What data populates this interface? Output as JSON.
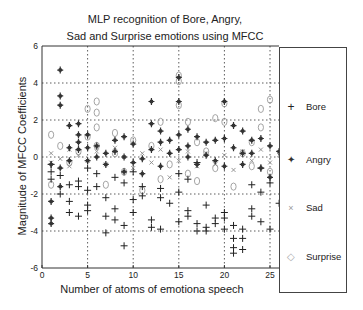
{
  "chart_data": {
    "type": "scatter",
    "title_lines": [
      "MLP recognition of Bore, Angry,",
      "Sad and Surprise emotions using MFCC"
    ],
    "xlabel": "Number of atoms of emotiona speech",
    "ylabel": "Magnitude of MFCC Coefficients",
    "xlim": [
      0,
      26
    ],
    "ylim": [
      -6,
      6
    ],
    "xticks": [
      0,
      5,
      10,
      15,
      20,
      25
    ],
    "yticks": [
      -6,
      -4,
      -2,
      0,
      2,
      4,
      6
    ],
    "grid": true,
    "legend_position": "right-outside",
    "series": [
      {
        "name": "Bore",
        "marker": "+",
        "color": "#222222",
        "points": [
          [
            1,
            -0.4
          ],
          [
            1,
            -0.8
          ],
          [
            1,
            -1.2
          ],
          [
            2,
            -1.0
          ],
          [
            2,
            -2.0
          ],
          [
            3,
            -1.5
          ],
          [
            3,
            -2.4
          ],
          [
            3,
            -3.0
          ],
          [
            4,
            -1.3
          ],
          [
            4,
            -1.6
          ],
          [
            4,
            -3.2
          ],
          [
            5,
            -0.6
          ],
          [
            5,
            -1.8
          ],
          [
            5,
            -2.6
          ],
          [
            5,
            -2.9
          ],
          [
            6,
            -0.9
          ],
          [
            6,
            -1.6
          ],
          [
            7,
            -2.2
          ],
          [
            7,
            -3.2
          ],
          [
            7,
            -4.1
          ],
          [
            8,
            -1.1
          ],
          [
            8,
            -2.8
          ],
          [
            8,
            -3.4
          ],
          [
            9,
            -1.4
          ],
          [
            9,
            -3.7
          ],
          [
            9,
            -4.8
          ],
          [
            10,
            -0.8
          ],
          [
            10,
            -2.3
          ],
          [
            10,
            -3.0
          ],
          [
            11,
            -1.6
          ],
          [
            11,
            -2.1
          ],
          [
            12,
            -3.4
          ],
          [
            12,
            -3.8
          ],
          [
            13,
            -1.7
          ],
          [
            13,
            -2.2
          ],
          [
            13,
            -3.9
          ],
          [
            14,
            -2.5
          ],
          [
            15,
            -0.9
          ],
          [
            15,
            -1.9
          ],
          [
            15,
            -3.5
          ],
          [
            16,
            -1.2
          ],
          [
            16,
            -2.9
          ],
          [
            16,
            -3.2
          ],
          [
            17,
            -0.3
          ],
          [
            17,
            -3.6
          ],
          [
            17,
            -4.0
          ],
          [
            18,
            -2.6
          ],
          [
            18,
            -3.8
          ],
          [
            18,
            -4.0
          ],
          [
            19,
            -3.3
          ],
          [
            19,
            -3.6
          ],
          [
            20,
            -3.0
          ],
          [
            20,
            -3.3
          ],
          [
            20,
            -3.9
          ],
          [
            21,
            -3.7
          ],
          [
            21,
            -4.4
          ],
          [
            21,
            -4.9
          ],
          [
            21,
            -5.2
          ],
          [
            22,
            -3.9
          ],
          [
            22,
            -4.4
          ],
          [
            22,
            -5.0
          ],
          [
            23,
            -1.5
          ],
          [
            23,
            -2.8
          ],
          [
            23,
            -3.2
          ],
          [
            24,
            -0.6
          ],
          [
            24,
            -1.9
          ],
          [
            24,
            -3.5
          ],
          [
            25,
            -1.4
          ],
          [
            25,
            -3.9
          ],
          [
            26,
            -2.5
          ]
        ]
      },
      {
        "name": "Angry",
        "marker": "*",
        "color": "#333333",
        "points": [
          [
            1,
            -0.4
          ],
          [
            1,
            -2.4
          ],
          [
            1,
            -3.3
          ],
          [
            1,
            -3.6
          ],
          [
            2,
            4.7
          ],
          [
            2,
            3.3
          ],
          [
            2,
            2.8
          ],
          [
            2,
            -0.6
          ],
          [
            2,
            -1.6
          ],
          [
            3,
            1.7
          ],
          [
            3,
            0.5
          ],
          [
            3,
            -0.2
          ],
          [
            4,
            1.8
          ],
          [
            4,
            1.2
          ],
          [
            4,
            0.8
          ],
          [
            4,
            0.4
          ],
          [
            5,
            1.2
          ],
          [
            5,
            0.5
          ],
          [
            5,
            -0.2
          ],
          [
            6,
            0.6
          ],
          [
            6,
            0.0
          ],
          [
            7,
            0.2
          ],
          [
            7,
            -0.4
          ],
          [
            8,
            0.9
          ],
          [
            8,
            0.3
          ],
          [
            9,
            1.1
          ],
          [
            9,
            0.0
          ],
          [
            9,
            -0.8
          ],
          [
            10,
            0.7
          ],
          [
            10,
            -0.3
          ],
          [
            11,
            -0.1
          ],
          [
            11,
            -0.9
          ],
          [
            12,
            3.0
          ],
          [
            12,
            1.8
          ],
          [
            12,
            0.4
          ],
          [
            13,
            1.4
          ],
          [
            13,
            0.8
          ],
          [
            13,
            -0.5
          ],
          [
            14,
            0.9
          ],
          [
            14,
            0.2
          ],
          [
            15,
            4.3
          ],
          [
            15,
            3.0
          ],
          [
            15,
            1.2
          ],
          [
            15,
            0.4
          ],
          [
            16,
            1.5
          ],
          [
            16,
            0.6
          ],
          [
            16,
            0.0
          ],
          [
            17,
            1.1
          ],
          [
            17,
            -0.4
          ],
          [
            18,
            0.8
          ],
          [
            18,
            0.1
          ],
          [
            19,
            0.9
          ],
          [
            19,
            -0.2
          ],
          [
            20,
            3.0
          ],
          [
            20,
            1.0
          ],
          [
            20,
            -0.5
          ],
          [
            21,
            1.7
          ],
          [
            21,
            0.5
          ],
          [
            22,
            1.4
          ],
          [
            22,
            0.2
          ],
          [
            22,
            -0.4
          ],
          [
            23,
            0.9
          ],
          [
            23,
            0.2
          ],
          [
            24,
            1.0
          ],
          [
            24,
            -0.6
          ],
          [
            25,
            0.6
          ],
          [
            25,
            -1.1
          ],
          [
            26,
            0.3
          ]
        ]
      },
      {
        "name": "Sad",
        "marker": "x",
        "color": "#8a8a8a",
        "points": [
          [
            1,
            0.2
          ],
          [
            1,
            -0.3
          ],
          [
            2,
            -0.1
          ],
          [
            3,
            0.4
          ],
          [
            3,
            -0.5
          ],
          [
            4,
            0.1
          ],
          [
            5,
            -0.2
          ],
          [
            6,
            0.3
          ],
          [
            7,
            -0.4
          ],
          [
            8,
            0.5
          ],
          [
            9,
            0.0
          ],
          [
            10,
            -0.6
          ],
          [
            11,
            0.2
          ],
          [
            12,
            -0.3
          ],
          [
            13,
            0.4
          ],
          [
            14,
            -1.1
          ],
          [
            15,
            -0.2
          ],
          [
            16,
            0.3
          ],
          [
            17,
            -0.5
          ],
          [
            18,
            0.2
          ],
          [
            19,
            -0.4
          ],
          [
            20,
            0.1
          ],
          [
            21,
            -0.7
          ],
          [
            22,
            0.3
          ],
          [
            23,
            -0.2
          ],
          [
            24,
            0.4
          ],
          [
            25,
            -0.3
          ],
          [
            26,
            0.1
          ]
        ]
      },
      {
        "name": "Surprise",
        "marker": "o",
        "color": "#9a9a9a",
        "points": [
          [
            1,
            1.2
          ],
          [
            1,
            -1.5
          ],
          [
            2,
            0.6
          ],
          [
            3,
            -0.3
          ],
          [
            4,
            0.3
          ],
          [
            5,
            2.6
          ],
          [
            5,
            1.1
          ],
          [
            6,
            3.0
          ],
          [
            6,
            2.4
          ],
          [
            6,
            1.6
          ],
          [
            6,
            0.6
          ],
          [
            7,
            -1.5
          ],
          [
            8,
            1.3
          ],
          [
            8,
            0.2
          ],
          [
            9,
            -0.8
          ],
          [
            10,
            0.9
          ],
          [
            11,
            -1.8
          ],
          [
            12,
            0.6
          ],
          [
            13,
            1.9
          ],
          [
            13,
            -1.2
          ],
          [
            14,
            -0.4
          ],
          [
            15,
            4.4
          ],
          [
            15,
            4.1
          ],
          [
            15,
            2.8
          ],
          [
            16,
            1.9
          ],
          [
            16,
            -0.9
          ],
          [
            17,
            0.8
          ],
          [
            17,
            -1.3
          ],
          [
            18,
            0.3
          ],
          [
            19,
            2.1
          ],
          [
            19,
            -0.6
          ],
          [
            20,
            2.9
          ],
          [
            20,
            1.9
          ],
          [
            21,
            -1.6
          ],
          [
            22,
            0.2
          ],
          [
            23,
            0.8
          ],
          [
            23,
            -0.5
          ],
          [
            24,
            2.6
          ],
          [
            24,
            1.6
          ],
          [
            25,
            3.1
          ],
          [
            25,
            -0.8
          ]
        ]
      }
    ]
  },
  "legend": {
    "items": [
      {
        "label": "Bore",
        "symbol": "+"
      },
      {
        "label": "Angry",
        "symbol": "✦"
      },
      {
        "label": "Sad",
        "symbol": "×"
      },
      {
        "label": "Surprise",
        "symbol": "◇"
      }
    ]
  },
  "axes": {
    "x_ticks": [
      "0",
      "5",
      "10",
      "15",
      "20",
      "25"
    ],
    "y_ticks": [
      "6",
      "4",
      "2",
      "0",
      "-2",
      "-4",
      "-6"
    ]
  }
}
